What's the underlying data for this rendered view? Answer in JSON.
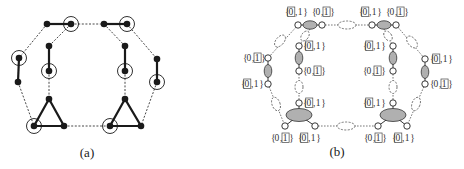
{
  "panels": [
    {
      "id": "a",
      "caption": "(a)",
      "description": "Graph with bold edges (matched pairs and triangles), dashed connecting edges; circled nodes highlighted"
    },
    {
      "id": "b",
      "caption": "(b)",
      "description": "Gadget graph: small open nodes labelled with sets {0,1}, shaded ellipses for bold components, dashed ellipses for dashed edges; boxed element indicates selected value"
    }
  ],
  "set_label": {
    "open": "{",
    "zero": "0",
    "comma": ",",
    "one": "1",
    "close": "}"
  },
  "panel_b_labels": [
    {
      "node": "top-left-left",
      "boxed": "0"
    },
    {
      "node": "top-left-right",
      "boxed": "1"
    },
    {
      "node": "top-right-left",
      "boxed": "0"
    },
    {
      "node": "top-right-right",
      "boxed": "1"
    },
    {
      "node": "outer-left-top",
      "boxed": "1"
    },
    {
      "node": "outer-left-bottom",
      "boxed": "0"
    },
    {
      "node": "inner-left-top",
      "boxed": "0"
    },
    {
      "node": "inner-left-bottom",
      "boxed": "1"
    },
    {
      "node": "inner-left-lower",
      "boxed": "0"
    },
    {
      "node": "inner-right-top",
      "boxed": "0"
    },
    {
      "node": "inner-right-bottom",
      "boxed": "1"
    },
    {
      "node": "inner-right-lower",
      "boxed": "0"
    },
    {
      "node": "outer-right-top",
      "boxed": "0"
    },
    {
      "node": "outer-right-bottom",
      "boxed": "1"
    },
    {
      "node": "bottom-left-left",
      "boxed": "1"
    },
    {
      "node": "bottom-left-right",
      "boxed": "0"
    },
    {
      "node": "bottom-right-left",
      "boxed": "1"
    },
    {
      "node": "bottom-right-right",
      "boxed": "0"
    }
  ],
  "colors": {
    "node_fill": "#1a1a1a",
    "edge": "#1a1a1a",
    "shaded_ellipse": "#b0b0b0",
    "dashed": "#555555"
  }
}
